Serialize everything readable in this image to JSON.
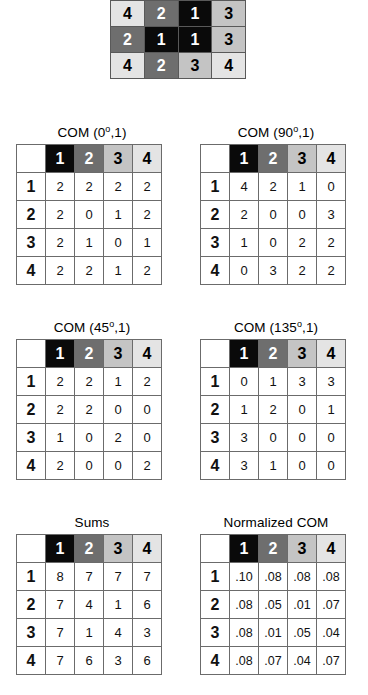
{
  "palette": {
    "level1": "#0a0a0a",
    "level2": "#6e6e6e",
    "level3": "#c4c4c4",
    "level4": "#e4e4e4",
    "background": "#ffffff",
    "gridline": "#6b6b6b"
  },
  "source_matrix": {
    "name": "source-image-matrix",
    "rows": [
      [
        "4",
        "4",
        "1",
        "4"
      ],
      [
        "4",
        "2",
        "1",
        "3"
      ],
      [
        "2",
        "1",
        "1",
        "3"
      ],
      [
        "4",
        "2",
        "3",
        "4"
      ]
    ]
  },
  "headers": {
    "col": [
      "1",
      "2",
      "3",
      "4"
    ],
    "row": [
      "1",
      "2",
      "3",
      "4"
    ]
  },
  "panels": [
    {
      "id": "com0",
      "title_prefix": "COM (0",
      "title_sup": "o",
      "title_suffix": ",1)",
      "title_full": "COM (0o,1)",
      "rows": [
        [
          "2",
          "2",
          "2",
          "2"
        ],
        [
          "2",
          "0",
          "1",
          "2"
        ],
        [
          "2",
          "1",
          "0",
          "1"
        ],
        [
          "2",
          "2",
          "1",
          "2"
        ]
      ]
    },
    {
      "id": "com90",
      "title_prefix": "COM (90",
      "title_sup": "o",
      "title_suffix": ",1)",
      "title_full": "COM (90o,1)",
      "rows": [
        [
          "4",
          "2",
          "1",
          "0"
        ],
        [
          "2",
          "0",
          "0",
          "3"
        ],
        [
          "1",
          "0",
          "2",
          "2"
        ],
        [
          "0",
          "3",
          "2",
          "2"
        ]
      ]
    },
    {
      "id": "com45",
      "title_prefix": "COM (45",
      "title_sup": "o",
      "title_suffix": ",1)",
      "title_full": "COM (45o,1)",
      "rows": [
        [
          "2",
          "2",
          "1",
          "2"
        ],
        [
          "2",
          "2",
          "0",
          "0"
        ],
        [
          "1",
          "0",
          "2",
          "0"
        ],
        [
          "2",
          "0",
          "0",
          "2"
        ]
      ]
    },
    {
      "id": "com135",
      "title_prefix": "COM (135",
      "title_sup": "o",
      "title_suffix": ",1)",
      "title_full": "COM (135o,1)",
      "rows": [
        [
          "0",
          "1",
          "3",
          "3"
        ],
        [
          "1",
          "2",
          "0",
          "1"
        ],
        [
          "3",
          "0",
          "0",
          "0"
        ],
        [
          "3",
          "1",
          "0",
          "0"
        ]
      ]
    },
    {
      "id": "sums",
      "title_prefix": "Sums",
      "title_sup": "",
      "title_suffix": "",
      "title_full": "Sums",
      "rows": [
        [
          "8",
          "7",
          "7",
          "7"
        ],
        [
          "7",
          "4",
          "1",
          "6"
        ],
        [
          "7",
          "1",
          "4",
          "3"
        ],
        [
          "7",
          "6",
          "3",
          "6"
        ]
      ]
    },
    {
      "id": "norm",
      "title_prefix": "Normalized COM",
      "title_sup": "",
      "title_suffix": "",
      "title_full": "Normalized COM",
      "rows": [
        [
          ".10",
          ".08",
          ".08",
          ".08"
        ],
        [
          ".08",
          ".05",
          ".01",
          ".07"
        ],
        [
          ".08",
          ".01",
          ".05",
          ".04"
        ],
        [
          ".08",
          ".07",
          ".04",
          ".07"
        ]
      ]
    }
  ]
}
